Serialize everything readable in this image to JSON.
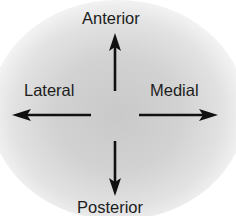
{
  "diagram": {
    "labels": {
      "top": "Anterior",
      "left": "Lateral",
      "right": "Medial",
      "bottom": "Posterior"
    },
    "arrows": [
      {
        "direction": "up",
        "points_to": "Anterior"
      },
      {
        "direction": "left",
        "points_to": "Lateral"
      },
      {
        "direction": "right",
        "points_to": "Medial"
      },
      {
        "direction": "down",
        "points_to": "Posterior"
      }
    ],
    "colors": {
      "arrow": "#111111",
      "text": "#1c1c1c",
      "background_center": "#c9c9c9",
      "background_edge": "#ffffff"
    }
  }
}
